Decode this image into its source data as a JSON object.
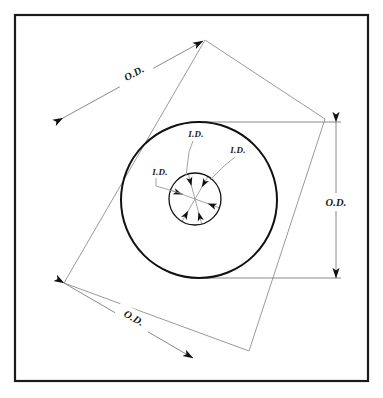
{
  "diagram": {
    "colors": {
      "background": "#ffffff",
      "frame": "#1a1a1a",
      "circle": "#111111",
      "dimension_line": "#8a8a8a",
      "arrowhead": "#111111",
      "leader": "#9a9a9a",
      "text": "#1a1a1a"
    },
    "frame": {
      "x": 15,
      "y": 15,
      "width": 353,
      "height": 366,
      "stroke_width": 2.2
    },
    "outer_circle": {
      "cx": 199,
      "cy": 200,
      "r": 78,
      "stroke_width": 2.0
    },
    "inner_circle": {
      "cx": 195,
      "cy": 199,
      "r": 26,
      "stroke_width": 1.3
    },
    "rotated_square": {
      "rotation_deg": -28,
      "points": "205,40 325,119 249,351 64,283"
    },
    "od_dimensions": [
      {
        "name": "od-top-left",
        "label": "O.D.",
        "x1": 63,
        "y1": 118,
        "x2": 203,
        "y2": 41,
        "label_x": 134,
        "label_y": 73,
        "label_rotation": -28.8
      },
      {
        "name": "od-bottom-left",
        "label": "O.D.",
        "x1": 64,
        "y1": 283,
        "x2": 193,
        "y2": 358,
        "label_x": 134,
        "label_y": 318,
        "label_rotation": 30.2
      },
      {
        "name": "od-right-vertical",
        "label": "O.D.",
        "x1": 336,
        "y1": 122,
        "x2": 336,
        "y2": 278,
        "label_x": 336,
        "label_y": 202,
        "label_rotation": 0
      }
    ],
    "extension_lines": [
      {
        "name": "ext-top",
        "x1": 206,
        "y1": 122,
        "x2": 341,
        "y2": 122
      },
      {
        "name": "ext-bottom",
        "x1": 206,
        "y1": 278,
        "x2": 341,
        "y2": 278
      }
    ],
    "id_labels": [
      {
        "name": "id-left",
        "label": "I.D.",
        "x": 160,
        "y": 175,
        "leader": "156,178 156,186 183,194"
      },
      {
        "name": "id-top",
        "label": "I.D.",
        "x": 196,
        "y": 137,
        "leader": "193,141 189,152 186,176"
      },
      {
        "name": "id-right",
        "label": "I.D.",
        "x": 238,
        "y": 153,
        "leader": "235,157 224,166 210,180"
      }
    ],
    "id_arrows": {
      "count": 6,
      "description": "six arrowheads on three diameters pointing inward to center",
      "angles_deg": [
        255,
        75,
        300,
        120,
        20,
        200
      ]
    }
  }
}
